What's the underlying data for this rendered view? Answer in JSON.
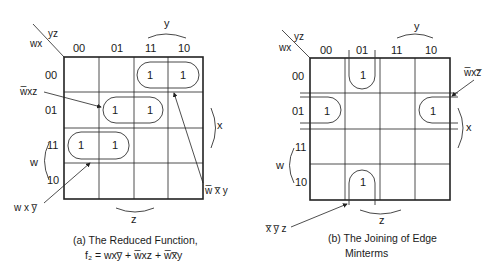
{
  "diagram_a": {
    "corner_top": "yz",
    "corner_left": "wx",
    "col_headers": [
      "00",
      "01",
      "11",
      "10"
    ],
    "row_headers": [
      "00",
      "01",
      "11",
      "10"
    ],
    "cells": [
      [
        "",
        "",
        "1",
        "1"
      ],
      [
        "",
        "1",
        "1",
        ""
      ],
      [
        "1",
        "1",
        "",
        ""
      ],
      [
        "",
        "",
        "",
        ""
      ]
    ],
    "var_y": "y",
    "var_x": "x",
    "var_w": "w",
    "var_z": "z",
    "group_labels": {
      "wbar_x_z": "w̅xz",
      "wbar_xbar_y": "w̅ x̅ y",
      "w_x_ybar": "w x y̅"
    },
    "caption_line1": "(a) The Reduced Function,",
    "caption_line2": "f₂ = wxy̅ + w̅xz + w̅x̅y"
  },
  "diagram_b": {
    "corner_top": "yz",
    "corner_left": "wx",
    "col_headers": [
      "00",
      "01",
      "11",
      "10"
    ],
    "row_headers": [
      "00",
      "01",
      "11",
      "10"
    ],
    "cells": [
      [
        "",
        "1",
        "",
        ""
      ],
      [
        "1",
        "",
        "",
        "1"
      ],
      [
        "",
        "",
        "",
        ""
      ],
      [
        "",
        "1",
        "",
        ""
      ]
    ],
    "var_y": "y",
    "var_x": "x",
    "var_w": "w",
    "var_z": "z",
    "group_labels": {
      "wbar_x_zbar": "w̅xz̅",
      "xbar_ybar_z": "x̅ y̅ z"
    },
    "caption_line1": "(b) The Joining of Edge",
    "caption_line2": "Minterms"
  }
}
